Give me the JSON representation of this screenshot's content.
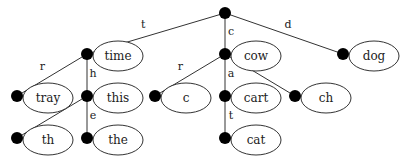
{
  "diagram": {
    "type": "trie",
    "root": {
      "x": 225,
      "y": 13
    },
    "nodes": [
      {
        "id": "time",
        "label": "time",
        "x": 87,
        "y": 54
      },
      {
        "id": "cow",
        "label": "cow",
        "x": 225,
        "y": 54
      },
      {
        "id": "dog",
        "label": "dog",
        "x": 343,
        "y": 54
      },
      {
        "id": "tray",
        "label": "tray",
        "x": 17,
        "y": 96
      },
      {
        "id": "this",
        "label": "this",
        "x": 87,
        "y": 96
      },
      {
        "id": "c",
        "label": "c",
        "x": 155,
        "y": 96
      },
      {
        "id": "cart",
        "label": "cart",
        "x": 225,
        "y": 96
      },
      {
        "id": "ch",
        "label": "ch",
        "x": 295,
        "y": 96
      },
      {
        "id": "th",
        "label": "th",
        "x": 17,
        "y": 138
      },
      {
        "id": "the",
        "label": "the",
        "x": 87,
        "y": 138
      },
      {
        "id": "cat",
        "label": "cat",
        "x": 225,
        "y": 138
      }
    ],
    "edges": [
      {
        "from": "root",
        "to": "time",
        "label": "t"
      },
      {
        "from": "root",
        "to": "cow",
        "label": "c"
      },
      {
        "from": "root",
        "to": "dog",
        "label": "d"
      },
      {
        "from": "time",
        "to": "tray",
        "label": "r"
      },
      {
        "from": "time",
        "to": "this",
        "label": "h"
      },
      {
        "from": "cow",
        "to": "c",
        "label": "r"
      },
      {
        "from": "cow",
        "to": "cart",
        "label": "a"
      },
      {
        "from": "cow",
        "to": "ch",
        "label": "h"
      },
      {
        "from": "this",
        "to": "th",
        "label": "r"
      },
      {
        "from": "this",
        "to": "the",
        "label": "e"
      },
      {
        "from": "cart",
        "to": "cat",
        "label": "t"
      }
    ]
  }
}
